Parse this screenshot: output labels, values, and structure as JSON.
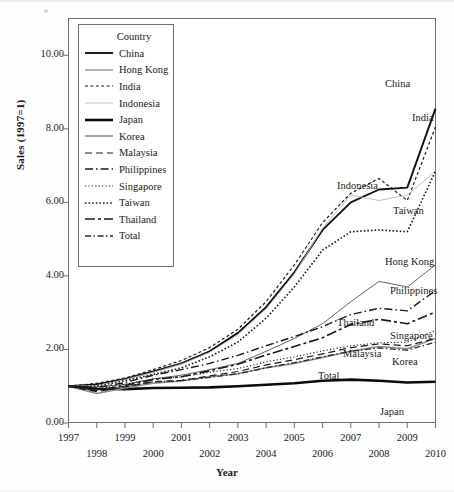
{
  "chart_data": {
    "type": "line",
    "title": "",
    "xlabel": "Year",
    "ylabel": "Sales (1997=1)",
    "xlim": [
      1997,
      2010
    ],
    "ylim": [
      0.0,
      11.0
    ],
    "yticks": [
      "0.00",
      "2.00",
      "4.00",
      "6.00",
      "8.00",
      "10.00"
    ],
    "ytick_values": [
      0,
      2,
      4,
      6,
      8,
      10
    ],
    "grid": false,
    "legend_position": "upper-left-inside",
    "legend_title": "Country",
    "x": [
      1997,
      1998,
      1999,
      2000,
      2001,
      2002,
      2003,
      2004,
      2005,
      2006,
      2007,
      2008,
      2009,
      2010
    ],
    "xtick_labels": [
      "1997",
      "1998",
      "1999",
      "2000",
      "2001",
      "2002",
      "2003",
      "2004",
      "2005",
      "2006",
      "2007",
      "2008",
      "2009",
      "2010"
    ],
    "series": [
      {
        "name": "China",
        "style": "solid",
        "width": 1.9,
        "color": "#111111",
        "end_label": "China",
        "values": [
          1.0,
          1.05,
          1.2,
          1.4,
          1.62,
          1.95,
          2.45,
          3.15,
          4.1,
          5.25,
          6.0,
          6.35,
          6.4,
          8.55
        ]
      },
      {
        "name": "Hong Kong",
        "style": "solid",
        "width": 0.9,
        "color": "#555555",
        "end_label": "Hong Kong",
        "values": [
          1.0,
          0.98,
          1.05,
          1.2,
          1.3,
          1.45,
          1.62,
          1.95,
          2.3,
          2.7,
          3.3,
          3.85,
          3.7,
          4.3
        ]
      },
      {
        "name": "India",
        "style": "dashed-fine",
        "width": 1.2,
        "color": "#1a1a1a",
        "end_label": "India",
        "values": [
          1.0,
          1.08,
          1.22,
          1.45,
          1.7,
          2.05,
          2.55,
          3.3,
          4.3,
          5.45,
          6.25,
          6.65,
          6.05,
          8.05
        ]
      },
      {
        "name": "Indonesia",
        "style": "solid",
        "width": 0.9,
        "color": "#bcbcbc",
        "end_label": "Indonesia",
        "values": [
          1.0,
          1.02,
          1.18,
          1.38,
          1.6,
          1.92,
          2.4,
          3.1,
          4.05,
          5.3,
          6.2,
          6.05,
          6.2,
          6.85
        ]
      },
      {
        "name": "Japan",
        "style": "solid",
        "width": 2.6,
        "color": "#0b0b0b",
        "end_label": "Japan",
        "values": [
          1.0,
          0.93,
          0.92,
          0.95,
          0.96,
          0.97,
          1.0,
          1.04,
          1.08,
          1.15,
          1.18,
          1.15,
          1.1,
          1.12
        ]
      },
      {
        "name": "Korea",
        "style": "solid",
        "width": 1.5,
        "color": "#8a8a8a",
        "end_label": "Korea",
        "values": [
          1.0,
          0.8,
          0.95,
          1.08,
          1.14,
          1.26,
          1.34,
          1.5,
          1.62,
          1.78,
          1.95,
          2.08,
          2.02,
          2.3
        ]
      },
      {
        "name": "Malaysia",
        "style": "dashed",
        "width": 1.2,
        "color": "#1a1a1a",
        "end_label": "Malaysia",
        "values": [
          1.0,
          0.85,
          0.98,
          1.12,
          1.16,
          1.28,
          1.4,
          1.58,
          1.72,
          1.88,
          2.05,
          2.15,
          2.1,
          2.3
        ]
      },
      {
        "name": "Philippines",
        "style": "dash-dot",
        "width": 1.4,
        "color": "#1a1a1a",
        "end_label": "Philippines",
        "values": [
          1.0,
          0.96,
          1.1,
          1.3,
          1.45,
          1.62,
          1.84,
          2.1,
          2.35,
          2.62,
          2.95,
          3.12,
          3.05,
          3.6
        ]
      },
      {
        "name": "Singapore",
        "style": "dotted",
        "width": 1.1,
        "color": "#1a1a1a",
        "end_label": "Singapore",
        "values": [
          1.0,
          0.92,
          1.05,
          1.2,
          1.25,
          1.38,
          1.48,
          1.66,
          1.8,
          1.96,
          2.1,
          2.18,
          2.2,
          2.52
        ]
      },
      {
        "name": "Taiwan",
        "style": "dotted-bold",
        "width": 1.6,
        "color": "#1a1a1a",
        "end_label": "Taiwan",
        "values": [
          1.0,
          1.0,
          1.15,
          1.32,
          1.5,
          1.8,
          2.2,
          2.85,
          3.7,
          4.7,
          5.2,
          5.25,
          5.2,
          6.85
        ]
      },
      {
        "name": "Thailand",
        "style": "long-dash-dot",
        "width": 1.6,
        "color": "#1a1a1a",
        "end_label": "Thailand",
        "values": [
          1.0,
          0.88,
          1.02,
          1.18,
          1.26,
          1.42,
          1.6,
          1.85,
          2.08,
          2.32,
          2.68,
          2.82,
          2.7,
          3.02
        ]
      },
      {
        "name": "Total",
        "style": "dash-dot-short",
        "width": 1.3,
        "color": "#2a2a2a",
        "end_label": "Total",
        "values": [
          1.0,
          0.9,
          1.0,
          1.12,
          1.15,
          1.24,
          1.34,
          1.5,
          1.64,
          1.8,
          1.95,
          2.04,
          1.98,
          2.2
        ]
      }
    ]
  },
  "legend": {
    "title": "Country",
    "items": [
      {
        "label": "China"
      },
      {
        "label": "Hong Kong"
      },
      {
        "label": "India"
      },
      {
        "label": "Indonesia"
      },
      {
        "label": "Japan"
      },
      {
        "label": "Korea"
      },
      {
        "label": "Malaysia"
      },
      {
        "label": "Philippines"
      },
      {
        "label": "Singapore"
      },
      {
        "label": "Taiwan"
      },
      {
        "label": "Thailand"
      },
      {
        "label": "Total"
      }
    ]
  },
  "axes": {
    "ylabel": "Sales (1997=1)",
    "xlabel": "Year"
  },
  "caption_ghost": ""
}
